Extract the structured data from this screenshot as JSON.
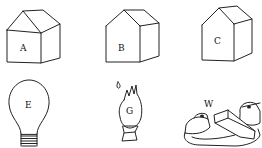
{
  "figures": [
    {
      "id": "house-a",
      "label": "A",
      "type": "house"
    },
    {
      "id": "house-b",
      "label": "B",
      "type": "house"
    },
    {
      "id": "house-c",
      "label": "C",
      "type": "house"
    },
    {
      "id": "light-bulb",
      "label": "E",
      "type": "light bulb"
    },
    {
      "id": "gas-flame",
      "label": "G",
      "type": "flame on stand"
    },
    {
      "id": "switch",
      "label": "W",
      "type": "knife switch / wire connector"
    }
  ],
  "labels": {
    "a": "A",
    "b": "B",
    "c": "C",
    "e": "E",
    "g": "G",
    "w": "W"
  }
}
